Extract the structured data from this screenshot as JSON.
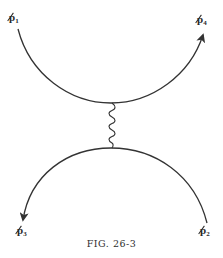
{
  "figure": {
    "caption": "FIG. 26-3",
    "type": "feynman-diagram",
    "colors": {
      "line": "#333333",
      "background": "#ffffff",
      "text": "#2a2a2a"
    },
    "external_lines": [
      {
        "id": "p1",
        "symbol": "p",
        "subscript": "1",
        "slashed": true,
        "arrow": "none",
        "position": "top-left"
      },
      {
        "id": "p4",
        "symbol": "p",
        "subscript": "4",
        "slashed": true,
        "arrow": "outgoing-up",
        "position": "top-right"
      },
      {
        "id": "p3",
        "symbol": "p",
        "subscript": "3",
        "slashed": true,
        "arrow": "outgoing-down",
        "position": "bottom-left"
      },
      {
        "id": "p2",
        "symbol": "p",
        "subscript": "2",
        "slashed": true,
        "arrow": "none",
        "position": "bottom-right"
      }
    ],
    "internal_line": {
      "style": "wavy",
      "represents": "photon-exchange",
      "orientation": "vertical"
    }
  },
  "labels": {
    "p1": {
      "base": "p",
      "sub": "1"
    },
    "p4": {
      "base": "p",
      "sub": "4"
    },
    "p3": {
      "base": "p",
      "sub": "3"
    },
    "p2": {
      "base": "p",
      "sub": "2"
    }
  }
}
